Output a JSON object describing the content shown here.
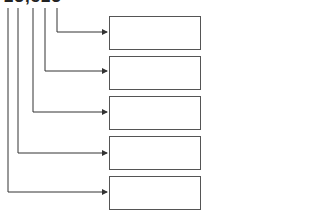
{
  "diagram": {
    "source_label": "23,523",
    "boxes": [
      {
        "label": ""
      },
      {
        "label": ""
      },
      {
        "label": ""
      },
      {
        "label": ""
      },
      {
        "label": ""
      }
    ],
    "line_color": "#333333",
    "box_border_color": "#555555"
  }
}
